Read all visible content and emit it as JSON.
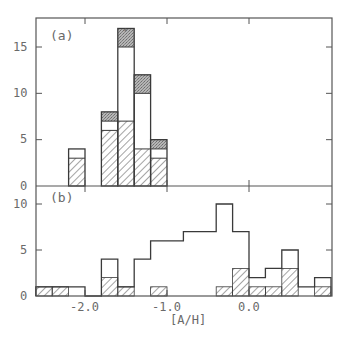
{
  "chart_data": [
    {
      "panel": "a",
      "type": "bar",
      "subtype": "stacked-histogram",
      "panel_label": "(a)",
      "xlabel": "[A/H]",
      "ylabel": "",
      "xlim": [
        -2.6,
        1.0
      ],
      "ylim": [
        0,
        18
      ],
      "yticks": [
        0,
        5,
        10,
        15
      ],
      "xticks": [
        -2.0,
        -1.0,
        0.0
      ],
      "bin_width": 0.2,
      "bins": [
        {
          "x_start": -2.2,
          "x_end": -2.0,
          "hatched": 3,
          "open": 1,
          "shaded": 0,
          "total": 4
        },
        {
          "x_start": -1.8,
          "x_end": -1.6,
          "hatched": 6,
          "open": 1,
          "shaded": 1,
          "total": 8
        },
        {
          "x_start": -1.6,
          "x_end": -1.4,
          "hatched": 7,
          "open": 8,
          "shaded": 2,
          "total": 17
        },
        {
          "x_start": -1.4,
          "x_end": -1.2,
          "hatched": 4,
          "open": 6,
          "shaded": 2,
          "total": 12
        },
        {
          "x_start": -1.2,
          "x_end": -1.0,
          "hatched": 3,
          "open": 1,
          "shaded": 1,
          "total": 5
        }
      ],
      "series": [
        {
          "name": "hatched",
          "style": "diagonal hatch"
        },
        {
          "name": "open",
          "style": "white"
        },
        {
          "name": "shaded",
          "style": "stippled grey"
        }
      ],
      "grid": false,
      "legend": "none"
    },
    {
      "panel": "b",
      "type": "bar",
      "subtype": "overlaid-histogram",
      "panel_label": "(b)",
      "xlabel": "[A/H]",
      "ylabel": "",
      "xlim": [
        -2.6,
        1.0
      ],
      "ylim": [
        0,
        11
      ],
      "yticks": [
        0,
        5,
        10
      ],
      "xticks": [
        -2.0,
        -1.0,
        0.0
      ],
      "xtick_labels": [
        "-2.0",
        "-1.0",
        "0.0"
      ],
      "bin_width": 0.2,
      "bins": [
        {
          "x_start": -2.6,
          "x_end": -2.4,
          "total": 1,
          "hatched": 1
        },
        {
          "x_start": -2.4,
          "x_end": -2.2,
          "total": 1,
          "hatched": 1
        },
        {
          "x_start": -2.2,
          "x_end": -2.0,
          "total": 1,
          "hatched": 0
        },
        {
          "x_start": -2.0,
          "x_end": -1.8,
          "total": 0,
          "hatched": 0
        },
        {
          "x_start": -1.8,
          "x_end": -1.6,
          "total": 4,
          "hatched": 2
        },
        {
          "x_start": -1.6,
          "x_end": -1.4,
          "total": 1,
          "hatched": 1
        },
        {
          "x_start": -1.4,
          "x_end": -1.2,
          "total": 4,
          "hatched": 0
        },
        {
          "x_start": -1.2,
          "x_end": -1.0,
          "total": 6,
          "hatched": 1
        },
        {
          "x_start": -1.0,
          "x_end": -0.8,
          "total": 6,
          "hatched": 0
        },
        {
          "x_start": -0.8,
          "x_end": -0.6,
          "total": 7,
          "hatched": 0
        },
        {
          "x_start": -0.6,
          "x_end": -0.4,
          "total": 7,
          "hatched": 0
        },
        {
          "x_start": -0.4,
          "x_end": -0.2,
          "total": 10,
          "hatched": 1
        },
        {
          "x_start": -0.2,
          "x_end": 0.0,
          "total": 7,
          "hatched": 3
        },
        {
          "x_start": 0.0,
          "x_end": 0.2,
          "total": 2,
          "hatched": 1
        },
        {
          "x_start": 0.2,
          "x_end": 0.4,
          "total": 3,
          "hatched": 1
        },
        {
          "x_start": 0.4,
          "x_end": 0.6,
          "total": 5,
          "hatched": 3
        },
        {
          "x_start": 0.6,
          "x_end": 0.8,
          "total": 1,
          "hatched": 0
        },
        {
          "x_start": 0.8,
          "x_end": 1.0,
          "total": 2,
          "hatched": 1
        }
      ],
      "grid": false,
      "legend": "none"
    }
  ],
  "labels": {
    "panel_a": "(a)",
    "panel_b": "(b)",
    "xlabel": "[A/H]",
    "xtick_labels": [
      "-2.0",
      "-1.0",
      "0.0"
    ],
    "ytick_labels_a": [
      "0",
      "5",
      "10",
      "15"
    ],
    "ytick_labels_b": [
      "0",
      "5",
      "10"
    ]
  },
  "colors": {
    "axis": "#555555",
    "outline": "#3a3a3a",
    "hatch": "#4a4a4a",
    "shaded": "#9a9a9a",
    "text": "#6a6a6a",
    "background": "#ffffff"
  }
}
